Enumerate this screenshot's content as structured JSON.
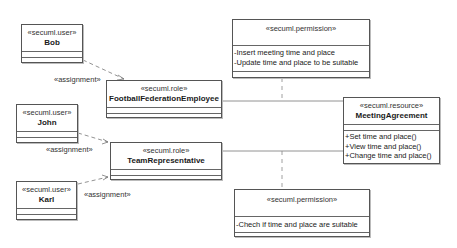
{
  "diagram": {
    "users": [
      {
        "stereotype": "«secuml.user»",
        "name": "Bob"
      },
      {
        "stereotype": "«secuml.user»",
        "name": "John"
      },
      {
        "stereotype": "«secuml.user»",
        "name": "Karl"
      }
    ],
    "roles": [
      {
        "stereotype": "«secuml.role»",
        "name": "FootballFederationEmployee"
      },
      {
        "stereotype": "«secuml.role»",
        "name": "TeamRepresentative"
      }
    ],
    "permissions": [
      {
        "stereotype": "«secuml.permission»",
        "actions": [
          "-Insert meeting time and place",
          "-Update time and place to be suitable"
        ]
      },
      {
        "stereotype": "«secuml.permission»",
        "actions": [
          "-Chech if time and place are suitable"
        ]
      }
    ],
    "resource": {
      "stereotype": "«secuml.resource»",
      "name": "MeetingAgreement",
      "operations": [
        "+Set time and place()",
        "+View time and place()",
        "+Change time and place()"
      ]
    },
    "assignments": [
      {
        "label": "«assignment»",
        "from": "Bob",
        "to": "FootballFederationEmployee"
      },
      {
        "label": "«assignment»",
        "from": "John",
        "to": "TeamRepresentative"
      },
      {
        "label": "«assignment»",
        "from": "Karl",
        "to": "TeamRepresentative"
      }
    ]
  }
}
